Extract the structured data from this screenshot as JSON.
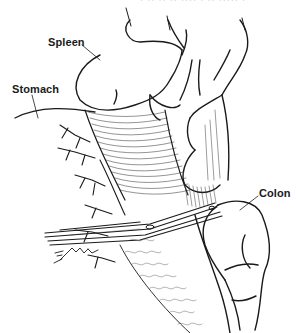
{
  "figure": {
    "caption_fragment": "· ·· ·· ·· ···· · ·· ····· ·",
    "labels": {
      "spleen": "Spleen",
      "stomach": "Stomach",
      "colon": "Colon"
    },
    "signature": "Schaik",
    "colors": {
      "ink": "#1a1a1a",
      "hatch": "#3a3a3a",
      "background": "#ffffff"
    }
  }
}
